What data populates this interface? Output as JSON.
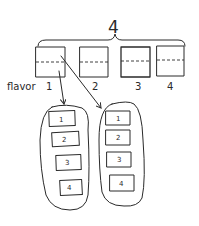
{
  "diagram": {
    "total_label": "4",
    "row_label": "flavor",
    "top_boxes": [
      {
        "label": "1"
      },
      {
        "label": "2"
      },
      {
        "label": "3"
      },
      {
        "label": "4"
      }
    ],
    "groups": [
      {
        "items": [
          "1",
          "2",
          "3",
          "4"
        ]
      },
      {
        "items": [
          "1",
          "2",
          "3",
          "4"
        ]
      }
    ],
    "ink_color": "#2a2a2a",
    "background": "#ffffff"
  }
}
